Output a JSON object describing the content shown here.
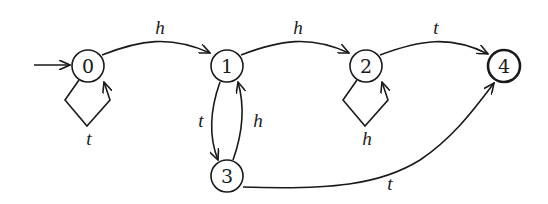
{
  "diagram": {
    "type": "finite-automaton",
    "start_state": "0",
    "accepting_states": [
      "4"
    ],
    "nodes": [
      {
        "id": "0",
        "label": "0"
      },
      {
        "id": "1",
        "label": "1"
      },
      {
        "id": "2",
        "label": "2"
      },
      {
        "id": "3",
        "label": "3"
      },
      {
        "id": "4",
        "label": "4"
      }
    ],
    "edges": [
      {
        "from": "0",
        "to": "0",
        "label": "t"
      },
      {
        "from": "0",
        "to": "1",
        "label": "h"
      },
      {
        "from": "1",
        "to": "2",
        "label": "h"
      },
      {
        "from": "1",
        "to": "3",
        "label": "t"
      },
      {
        "from": "3",
        "to": "1",
        "label": "h"
      },
      {
        "from": "2",
        "to": "2",
        "label": "h"
      },
      {
        "from": "2",
        "to": "4",
        "label": "t"
      },
      {
        "from": "3",
        "to": "4",
        "label": "t"
      }
    ]
  }
}
